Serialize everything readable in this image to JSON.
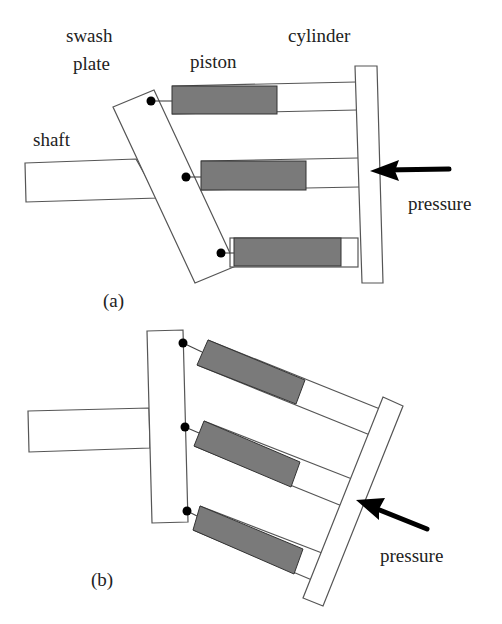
{
  "figure_a": {
    "caption": "(a)",
    "labels": {
      "swash_line1": "swash",
      "swash_line2": "plate",
      "piston": "piston",
      "cylinder": "cylinder",
      "shaft": "shaft",
      "pressure": "pressure"
    }
  },
  "figure_b": {
    "caption": "(b)",
    "labels": {
      "pressure": "pressure"
    }
  },
  "colors": {
    "piston_fill": "#7a7a7a",
    "outline": "#555555",
    "pivot": "#000000",
    "arrow": "#000000"
  }
}
